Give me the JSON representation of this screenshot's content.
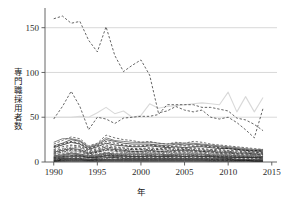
{
  "chart_data": {
    "type": "line",
    "title": "",
    "xlabel": "年",
    "ylabel": "専門職採用者数",
    "xlim": [
      1989.0,
      2015.6
    ],
    "ylim": [
      0,
      172
    ],
    "grid": true,
    "grid_axis": "y",
    "legend": "none",
    "xticks": [
      1990,
      1995,
      2000,
      2005,
      2010,
      2015
    ],
    "xticklabels": [
      "1990",
      "1995",
      "2000",
      "2005",
      "2010",
      "2015"
    ],
    "yticks": [
      0,
      50,
      100,
      150
    ],
    "yticklabels": [
      "0",
      "50",
      "100",
      "150"
    ],
    "x": [
      1990,
      1991,
      1992,
      1993,
      1994,
      1995,
      1996,
      1997,
      1998,
      1999,
      2000,
      2001,
      2002,
      2003,
      2004,
      2005,
      2006,
      2007,
      2008,
      2009,
      2010,
      2011,
      2012,
      2013,
      2014
    ],
    "series": [
      {
        "name": "series-01-top",
        "style": "dashed",
        "color": "#333333",
        "values": [
          160,
          163,
          155,
          157,
          136,
          123,
          151,
          119,
          101,
          108,
          114,
          97,
          55,
          57,
          62,
          58,
          56,
          58,
          50,
          48,
          50,
          44,
          36,
          27,
          60
        ]
      },
      {
        "name": "series-02",
        "style": "dashed",
        "color": "#333333",
        "values": [
          48,
          62,
          79,
          62,
          36,
          50,
          48,
          43,
          49,
          50,
          51,
          51,
          53,
          64,
          64,
          64,
          64,
          61,
          61,
          59,
          57,
          49,
          47,
          42,
          35
        ]
      },
      {
        "name": "series-03-gray",
        "style": "solid",
        "color": "#d9d9d9",
        "values": [
          50,
          50,
          50,
          51,
          50,
          55,
          61,
          54,
          57,
          50,
          52,
          65,
          60,
          62,
          63,
          64,
          65,
          66,
          65,
          64,
          78,
          56,
          73,
          56,
          72
        ]
      },
      {
        "name": "series-04",
        "style": "dashed",
        "color": "#444444",
        "values": [
          20,
          24,
          28,
          26,
          18,
          21,
          30,
          27,
          25,
          24,
          22,
          23,
          21,
          20,
          22,
          21,
          23,
          22,
          20,
          19,
          18,
          17,
          16,
          15,
          14
        ]
      },
      {
        "name": "series-05",
        "style": "solid",
        "color": "#222222",
        "values": [
          16,
          19,
          22,
          20,
          14,
          17,
          21,
          19,
          18,
          17,
          17,
          18,
          17,
          16,
          17,
          16,
          17,
          17,
          16,
          15,
          15,
          14,
          13,
          12,
          12
        ]
      },
      {
        "name": "series-06",
        "style": "dashed",
        "color": "#555555",
        "values": [
          13,
          15,
          18,
          17,
          12,
          14,
          17,
          16,
          15,
          14,
          14,
          15,
          14,
          14,
          15,
          14,
          15,
          14,
          13,
          13,
          12,
          12,
          11,
          11,
          10
        ]
      },
      {
        "name": "series-07",
        "style": "solid",
        "color": "#2a2a2a",
        "values": [
          11,
          13,
          15,
          14,
          10,
          12,
          15,
          14,
          13,
          12,
          12,
          13,
          12,
          12,
          13,
          13,
          13,
          12,
          12,
          11,
          11,
          10,
          10,
          9,
          9
        ]
      },
      {
        "name": "series-08",
        "style": "dashdot",
        "color": "#3a3a3a",
        "values": [
          9,
          11,
          13,
          12,
          9,
          11,
          13,
          12,
          11,
          11,
          11,
          11,
          11,
          10,
          11,
          11,
          11,
          11,
          10,
          10,
          10,
          9,
          9,
          8,
          8
        ]
      },
      {
        "name": "series-09",
        "style": "dashed",
        "color": "#4a4a4a",
        "values": [
          8,
          9,
          11,
          11,
          8,
          9,
          11,
          10,
          10,
          10,
          10,
          10,
          10,
          9,
          10,
          10,
          10,
          10,
          9,
          9,
          9,
          8,
          8,
          8,
          7
        ]
      },
      {
        "name": "series-10",
        "style": "solid",
        "color": "#333333",
        "values": [
          7,
          8,
          10,
          9,
          7,
          8,
          10,
          9,
          9,
          9,
          9,
          9,
          9,
          8,
          9,
          9,
          9,
          9,
          8,
          8,
          8,
          7,
          7,
          7,
          6
        ]
      },
      {
        "name": "series-11",
        "style": "dotted",
        "color": "#555555",
        "values": [
          6,
          7,
          8,
          8,
          6,
          7,
          9,
          8,
          8,
          8,
          8,
          8,
          8,
          8,
          8,
          8,
          8,
          8,
          7,
          7,
          7,
          7,
          6,
          6,
          6
        ]
      },
      {
        "name": "series-12",
        "style": "dashed",
        "color": "#2f2f2f",
        "values": [
          5,
          6,
          7,
          7,
          5,
          6,
          8,
          7,
          7,
          7,
          7,
          7,
          7,
          7,
          7,
          7,
          7,
          7,
          7,
          6,
          6,
          6,
          6,
          5,
          5
        ]
      },
      {
        "name": "series-13",
        "style": "solid",
        "color": "#1f1f1f",
        "values": [
          4,
          5,
          6,
          6,
          5,
          5,
          7,
          6,
          6,
          6,
          6,
          6,
          6,
          6,
          6,
          6,
          6,
          6,
          6,
          5,
          5,
          5,
          5,
          5,
          4
        ]
      },
      {
        "name": "series-14",
        "style": "dashed",
        "color": "#3d3d3d",
        "values": [
          4,
          4,
          5,
          5,
          4,
          5,
          6,
          5,
          5,
          5,
          5,
          5,
          5,
          5,
          5,
          5,
          5,
          5,
          5,
          5,
          4,
          4,
          4,
          4,
          4
        ]
      },
      {
        "name": "series-15",
        "style": "solid",
        "color": "#262626",
        "values": [
          3,
          4,
          4,
          4,
          3,
          4,
          5,
          5,
          4,
          4,
          4,
          4,
          4,
          4,
          4,
          4,
          4,
          4,
          4,
          4,
          4,
          3,
          3,
          3,
          3
        ]
      },
      {
        "name": "series-16",
        "style": "dashdot",
        "color": "#444444",
        "values": [
          3,
          3,
          4,
          4,
          3,
          3,
          4,
          4,
          4,
          4,
          4,
          4,
          4,
          4,
          4,
          4,
          4,
          4,
          3,
          3,
          3,
          3,
          3,
          3,
          3
        ]
      },
      {
        "name": "series-17",
        "style": "solid",
        "color": "#141414",
        "values": [
          2,
          3,
          3,
          3,
          2,
          3,
          3,
          3,
          3,
          3,
          3,
          3,
          3,
          3,
          3,
          3,
          3,
          3,
          3,
          3,
          3,
          2,
          2,
          2,
          2
        ]
      },
      {
        "name": "series-18",
        "style": "dashed",
        "color": "#505050",
        "values": [
          2,
          2,
          3,
          3,
          2,
          2,
          3,
          3,
          3,
          3,
          3,
          3,
          3,
          3,
          3,
          3,
          3,
          3,
          2,
          2,
          2,
          2,
          2,
          2,
          2
        ]
      },
      {
        "name": "series-19",
        "style": "solid",
        "color": "#0d0d0d",
        "values": [
          1,
          2,
          2,
          2,
          2,
          2,
          2,
          2,
          2,
          2,
          2,
          2,
          2,
          2,
          2,
          2,
          2,
          2,
          2,
          2,
          2,
          2,
          2,
          1,
          1
        ]
      },
      {
        "name": "series-20",
        "style": "dotted",
        "color": "#3a3a3a",
        "values": [
          1,
          1,
          2,
          2,
          1,
          1,
          2,
          2,
          2,
          2,
          2,
          2,
          2,
          2,
          2,
          2,
          2,
          2,
          1,
          1,
          1,
          1,
          1,
          1,
          1
        ]
      },
      {
        "name": "series-21",
        "style": "solid",
        "color": "#000000",
        "values": [
          1,
          1,
          1,
          1,
          1,
          1,
          1,
          1,
          1,
          1,
          1,
          1,
          1,
          1,
          1,
          1,
          1,
          1,
          1,
          1,
          1,
          1,
          1,
          1,
          1
        ]
      },
      {
        "name": "series-22",
        "style": "dashed",
        "color": "#2b2b2b",
        "values": [
          14,
          17,
          19,
          18,
          13,
          15,
          19,
          17,
          16,
          15,
          15,
          16,
          15,
          15,
          16,
          15,
          16,
          15,
          14,
          14,
          13,
          13,
          12,
          11,
          11
        ]
      },
      {
        "name": "series-23",
        "style": "solid",
        "color": "#353535",
        "values": [
          18,
          21,
          25,
          23,
          16,
          19,
          25,
          23,
          21,
          20,
          20,
          20,
          19,
          18,
          20,
          19,
          20,
          19,
          18,
          17,
          16,
          15,
          14,
          13,
          13
        ]
      },
      {
        "name": "series-24",
        "style": "dashed",
        "color": "#1c1c1c",
        "values": [
          10,
          12,
          14,
          13,
          9,
          11,
          14,
          13,
          12,
          12,
          12,
          12,
          12,
          11,
          12,
          12,
          12,
          12,
          11,
          10,
          10,
          9,
          9,
          9,
          8
        ]
      },
      {
        "name": "series-25",
        "style": "solid",
        "color": "#474747",
        "values": [
          6,
          7,
          9,
          8,
          6,
          7,
          9,
          8,
          8,
          8,
          8,
          8,
          8,
          7,
          8,
          8,
          8,
          8,
          7,
          7,
          7,
          6,
          6,
          6,
          6
        ]
      },
      {
        "name": "series-26",
        "style": "dashdot",
        "color": "#232323",
        "values": [
          12,
          14,
          16,
          16,
          11,
          13,
          17,
          15,
          14,
          14,
          14,
          14,
          14,
          13,
          14,
          14,
          14,
          13,
          13,
          12,
          12,
          11,
          11,
          10,
          10
        ]
      },
      {
        "name": "series-27",
        "style": "solid",
        "color": "#5a5a5a",
        "values": [
          22,
          26,
          26,
          24,
          17,
          20,
          27,
          24,
          23,
          22,
          22,
          22,
          21,
          20,
          21,
          21,
          21,
          20,
          19,
          18,
          17,
          16,
          15,
          14,
          14
        ]
      },
      {
        "name": "series-28",
        "style": "dashed",
        "color": "#111111",
        "values": [
          17,
          20,
          23,
          21,
          15,
          18,
          23,
          21,
          19,
          18,
          18,
          19,
          18,
          17,
          18,
          18,
          18,
          18,
          17,
          16,
          15,
          14,
          13,
          13,
          12
        ]
      },
      {
        "name": "series-29",
        "style": "dotted",
        "color": "#666666",
        "values": [
          9,
          10,
          12,
          12,
          9,
          10,
          13,
          12,
          11,
          11,
          11,
          11,
          11,
          11,
          11,
          11,
          11,
          11,
          10,
          10,
          10,
          9,
          9,
          8,
          8
        ]
      },
      {
        "name": "series-30",
        "style": "solid",
        "color": "#2e2e2e",
        "values": [
          5,
          6,
          7,
          7,
          5,
          6,
          7,
          7,
          7,
          6,
          6,
          7,
          6,
          6,
          7,
          6,
          7,
          6,
          6,
          6,
          6,
          5,
          5,
          5,
          5
        ]
      }
    ]
  }
}
